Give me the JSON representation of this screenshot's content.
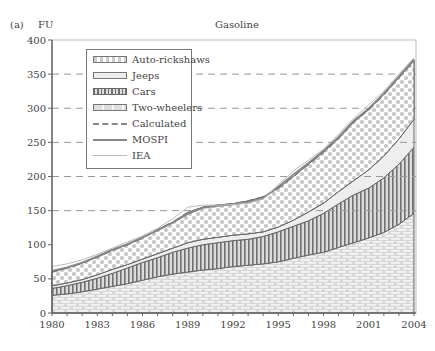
{
  "panel_label": "(a)",
  "chart_data": {
    "type": "area",
    "stacked": true,
    "title": "Gasoline",
    "xlabel": "",
    "ylabel": "FU",
    "xlim": [
      1980,
      2004
    ],
    "ylim": [
      0,
      400
    ],
    "yticks": [
      0,
      50,
      100,
      150,
      200,
      250,
      300,
      350,
      400
    ],
    "xticks": [
      1980,
      1983,
      1986,
      1989,
      1992,
      1995,
      1998,
      2001,
      2004
    ],
    "grid": "horizontal dashed at 150, 200, 250, 300, 350",
    "legend_position": "upper left",
    "x": [
      1980,
      1981,
      1982,
      1983,
      1984,
      1985,
      1986,
      1987,
      1988,
      1989,
      1990,
      1991,
      1992,
      1993,
      1994,
      1995,
      1996,
      1997,
      1998,
      1999,
      2000,
      2001,
      2002,
      2003,
      2004
    ],
    "series": [
      {
        "name": "Two-wheelers",
        "kind": "stacked-area",
        "cumulative_top": [
          26,
          28,
          31,
          35,
          39,
          43,
          48,
          53,
          57,
          60,
          63,
          65,
          68,
          70,
          72,
          75,
          80,
          85,
          89,
          96,
          103,
          110,
          118,
          130,
          146
        ]
      },
      {
        "name": "Cars",
        "kind": "stacked-area",
        "cumulative_top": [
          36,
          40,
          45,
          51,
          58,
          66,
          74,
          81,
          89,
          95,
          100,
          103,
          106,
          108,
          112,
          119,
          127,
          135,
          146,
          160,
          173,
          183,
          198,
          218,
          243
        ]
      },
      {
        "name": "Jeeps",
        "kind": "stacked-area",
        "cumulative_top": [
          40,
          44,
          49,
          56,
          64,
          71,
          79,
          87,
          95,
          103,
          108,
          111,
          114,
          116,
          119,
          126,
          136,
          148,
          161,
          178,
          194,
          210,
          230,
          255,
          284
        ]
      },
      {
        "name": "Auto-rickshaws",
        "kind": "stacked-area",
        "cumulative_top": [
          60,
          66,
          73,
          82,
          92,
          100,
          110,
          122,
          133,
          147,
          155,
          158,
          160,
          164,
          170,
          183,
          200,
          218,
          236,
          256,
          280,
          298,
          320,
          345,
          370
        ]
      },
      {
        "name": "Calculated",
        "kind": "dashed-line",
        "values": [
          60,
          66,
          73,
          82,
          92,
          100,
          110,
          122,
          133,
          147,
          155,
          158,
          160,
          164,
          170,
          183,
          200,
          218,
          236,
          256,
          280,
          298,
          320,
          345,
          370
        ]
      },
      {
        "name": "MOSPI",
        "kind": "solid-line",
        "values": [
          62,
          67,
          74,
          83,
          93,
          101,
          111,
          121,
          132,
          145,
          154,
          157,
          159,
          162,
          168,
          185,
          203,
          220,
          238,
          258,
          282,
          300,
          322,
          347,
          372
        ]
      },
      {
        "name": "IEA",
        "kind": "thin-line",
        "values": [
          68,
          72,
          78,
          86,
          95,
          104,
          113,
          124,
          138,
          155,
          158,
          158,
          159,
          161,
          167,
          188,
          208,
          224,
          240,
          262,
          285,
          305,
          325,
          350,
          374
        ]
      }
    ]
  },
  "legend": [
    {
      "label": "Auto-rickshaws",
      "swatch": "dots"
    },
    {
      "label": "Jeeps",
      "swatch": "light"
    },
    {
      "label": "Cars",
      "swatch": "vstripes"
    },
    {
      "label": "Two-wheelers",
      "swatch": "bricks"
    },
    {
      "label": "Calculated",
      "swatch": "dashed"
    },
    {
      "label": "MOSPI",
      "swatch": "solid"
    },
    {
      "label": "IEA",
      "swatch": "thin"
    }
  ],
  "colors": {
    "axis": "#666666",
    "grid": "#999999",
    "dots": "#c8c8c8",
    "jeeps": "#eeeeee",
    "cars_stripe": "#707070",
    "bricks_fill": "#e4e4e4",
    "line_dark": "#777777",
    "line_light": "#bbbbbb"
  }
}
